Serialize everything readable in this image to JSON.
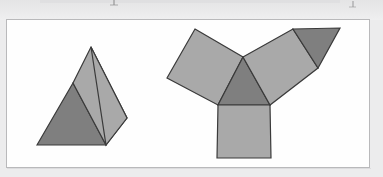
{
  "page": {
    "background_color": "#ececed",
    "frame": {
      "background_color": "#fefefe",
      "border_color": "#b9b9bb",
      "x": 6,
      "y": 19,
      "width": 364,
      "height": 149
    }
  },
  "diagram": {
    "title": "",
    "colors": {
      "light_face": "#a9a9a9",
      "dark_face": "#7f7f7f",
      "outline": "#3a3a3a",
      "outline_width": 1.2
    },
    "figures": [
      {
        "name": "triangular-prism-solid",
        "label": "",
        "faces": [
          {
            "name": "prism-front-triangle-face",
            "shade": "dark",
            "points": "37,145 73,83 106,145"
          },
          {
            "name": "prism-slanted-rectangular-face",
            "shade": "light",
            "points": "73,83 91,47 127,118 106,145"
          },
          {
            "name": "prism-right-triangle-face",
            "shade": "light",
            "points": "91,47 127,118 106,145"
          }
        ]
      },
      {
        "name": "triangular-prism-net",
        "label": "",
        "faces": [
          {
            "name": "net-left-rectangle-flap",
            "shade": "light",
            "points": "195,29 243,57 218,105 167,78"
          },
          {
            "name": "net-center-triangle",
            "shade": "dark",
            "points": "243,57 270,105 218,105"
          },
          {
            "name": "net-bottom-square-flap",
            "shade": "light",
            "points": "218,105 270,105 271,158 217,158"
          },
          {
            "name": "net-right-rectangle-flap",
            "shade": "light",
            "points": "243,57 293,29 318,68 270,105"
          },
          {
            "name": "net-right-triangle-flap",
            "shade": "dark",
            "points": "293,29 340,28 318,68"
          }
        ]
      }
    ]
  }
}
